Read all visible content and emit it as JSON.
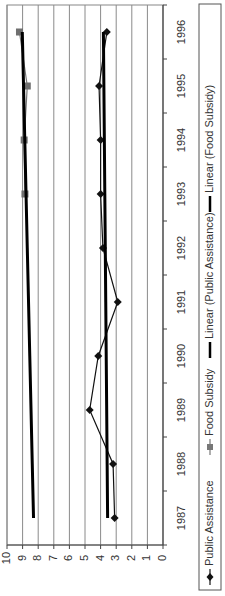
{
  "chart_data": {
    "type": "line",
    "orientation": "rotated-90-clockwise",
    "title": "",
    "xlabel": "",
    "ylabel": "",
    "categories": [
      "1987",
      "1988",
      "1989",
      "1990",
      "1991",
      "1992",
      "1993",
      "1994",
      "1995",
      "1996"
    ],
    "ylim": [
      0,
      10
    ],
    "yticks": [
      "0",
      "1",
      "2",
      "3",
      "4",
      "5",
      "6",
      "7",
      "8",
      "9",
      "10"
    ],
    "grid": true,
    "series": [
      {
        "name": "Public Assistance",
        "marker": "diamond",
        "color": "#111111",
        "values": [
          3.1,
          3.2,
          4.7,
          4.15,
          2.9,
          3.85,
          4.0,
          4.0,
          4.1,
          3.6
        ]
      },
      {
        "name": "Food Subsidy",
        "marker": "square",
        "color": "#777777",
        "values": [
          null,
          null,
          null,
          null,
          null,
          null,
          8.85,
          8.9,
          8.7,
          9.2
        ]
      },
      {
        "name": "Linear (Public Assistance)",
        "type": "trendline",
        "color": "#000000",
        "values": [
          3.55,
          3.58,
          3.61,
          3.64,
          3.67,
          3.7,
          3.73,
          3.76,
          3.79,
          3.82
        ]
      },
      {
        "name": "Linear (Food Subsidy)",
        "type": "trendline",
        "color": "#000000",
        "values": [
          8.3,
          8.38,
          8.46,
          8.54,
          8.62,
          8.7,
          8.78,
          8.86,
          8.94,
          9.02
        ]
      }
    ],
    "legend": {
      "position": "bottom",
      "entries": [
        "Public Assistance",
        "Food Subsidy",
        "Linear (Public Assistance)",
        "Linear (Food Subsidy)"
      ]
    }
  },
  "legend": {
    "items": [
      {
        "label": "Public Assistance"
      },
      {
        "label": "Food Subsidy"
      },
      {
        "label": "Linear (Public Assistance)"
      },
      {
        "label": "Linear (Food Subsidy)"
      }
    ]
  }
}
